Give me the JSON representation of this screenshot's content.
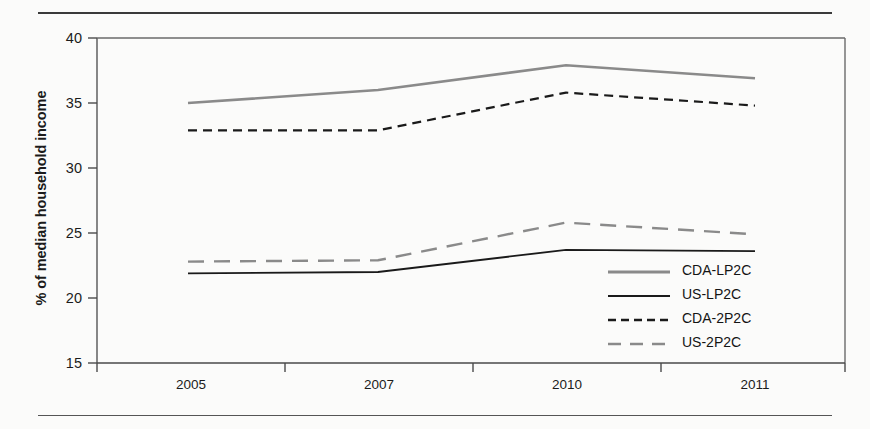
{
  "chart_data": {
    "type": "line",
    "title": "",
    "xlabel": "",
    "ylabel": "% of median household income",
    "x": [
      "2005",
      "2007",
      "2010",
      "2011"
    ],
    "categories": [
      "2005",
      "2007",
      "2010",
      "2011"
    ],
    "ylim": [
      15,
      40
    ],
    "yticks": [
      15,
      20,
      25,
      30,
      35,
      40
    ],
    "grid": false,
    "legend_position": "inside-right",
    "series": [
      {
        "name": "CDA-LP2C",
        "values": [
          35.0,
          36.0,
          37.9,
          36.9
        ],
        "color": "#8a8a8a",
        "style": "solid"
      },
      {
        "name": "US-LP2C",
        "values": [
          21.9,
          22.0,
          23.7,
          23.6
        ],
        "color": "#1a1a1a",
        "style": "solid"
      },
      {
        "name": "CDA-2P2C",
        "values": [
          32.9,
          32.9,
          35.8,
          34.8
        ],
        "color": "#1a1a1a",
        "style": "dashed-short"
      },
      {
        "name": "US-2P2C",
        "values": [
          22.8,
          22.9,
          25.8,
          24.9
        ],
        "color": "#8a8a8a",
        "style": "dashed-long"
      }
    ]
  },
  "axis": {
    "y_tick_labels": [
      "40",
      "35",
      "30",
      "25",
      "20",
      "15"
    ],
    "x_tick_labels": [
      "2005",
      "2007",
      "2010",
      "2011"
    ],
    "y_axis_title": "% of median household income"
  },
  "legend": {
    "items": [
      {
        "label": "CDA-LP2C"
      },
      {
        "label": "US-LP2C"
      },
      {
        "label": "CDA-2P2C"
      },
      {
        "label": "US-2P2C"
      }
    ]
  }
}
